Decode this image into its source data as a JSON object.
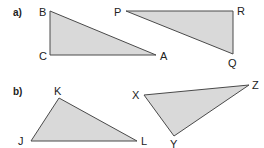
{
  "colors": {
    "fill": "#d9d9d9",
    "stroke": "#4a4a4a",
    "text": "#222222",
    "background": "#ffffff"
  },
  "parts": [
    {
      "label": "a)",
      "triangles": [
        {
          "name": "ABC",
          "vertices": [
            {
              "label": "B",
              "x": 50,
              "y": 11
            },
            {
              "label": "C",
              "x": 50,
              "y": 55
            },
            {
              "label": "A",
              "x": 156,
              "y": 55
            }
          ]
        },
        {
          "name": "PQR",
          "vertices": [
            {
              "label": "P",
              "x": 126,
              "y": 11
            },
            {
              "label": "R",
              "x": 233,
              "y": 11
            },
            {
              "label": "Q",
              "x": 233,
              "y": 54
            }
          ]
        }
      ]
    },
    {
      "label": "b)",
      "triangles": [
        {
          "name": "JKL",
          "vertices": [
            {
              "label": "K",
              "x": 59,
              "y": 98
            },
            {
              "label": "J",
              "x": 31,
              "y": 141
            },
            {
              "label": "L",
              "x": 137,
              "y": 141
            }
          ]
        },
        {
          "name": "XYZ",
          "vertices": [
            {
              "label": "X",
              "x": 144,
              "y": 95
            },
            {
              "label": "Z",
              "x": 249,
              "y": 85
            },
            {
              "label": "Y",
              "x": 174,
              "y": 136
            }
          ]
        }
      ]
    }
  ]
}
